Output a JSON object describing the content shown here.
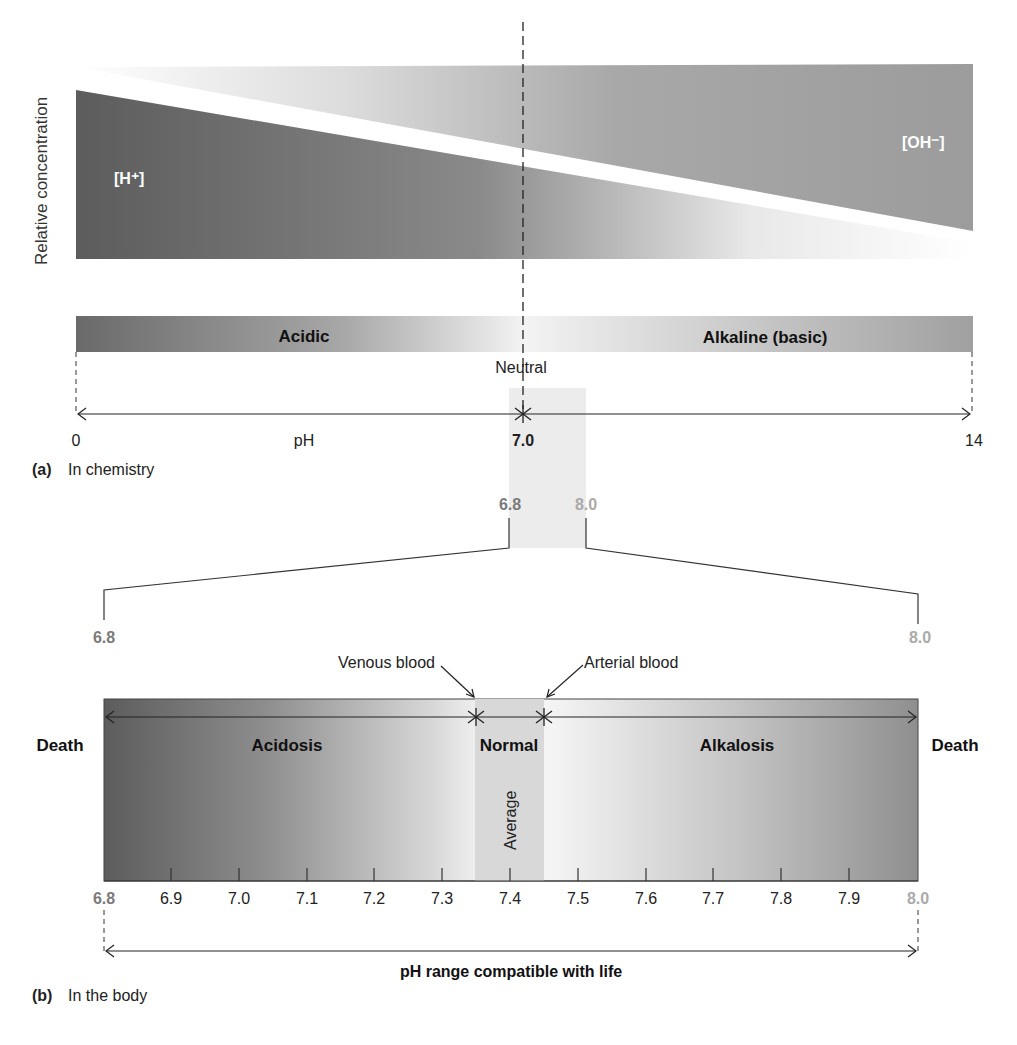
{
  "panel_a": {
    "y_axis_label": "Relative concentration",
    "h_label": "[H⁺]",
    "oh_label": "[OH⁻]",
    "bar_acidic": "Acidic",
    "bar_alkaline": "Alkaline (basic)",
    "neutral_label": "Neutral",
    "scale_min": "0",
    "scale_mid": "7.0",
    "scale_max": "14",
    "axis_name": "pH",
    "caption_letter": "(a)",
    "caption_text": "In chemistry",
    "zoom_low": "6.8",
    "zoom_high": "8.0"
  },
  "panel_b": {
    "range_low": "6.8",
    "range_high": "8.0",
    "venous_label": "Venous blood",
    "arterial_label": "Arterial blood",
    "death_left": "Death",
    "death_right": "Death",
    "acidosis": "Acidosis",
    "normal": "Normal",
    "alkalosis": "Alkalosis",
    "average": "Average",
    "ticks": [
      "6.8",
      "6.9",
      "7.0",
      "7.1",
      "7.2",
      "7.3",
      "7.4",
      "7.5",
      "7.6",
      "7.7",
      "7.8",
      "7.9",
      "8.0"
    ],
    "life_range_label": "pH range compatible with life",
    "caption_letter": "(b)",
    "caption_text": "In the body"
  },
  "colors": {
    "dark_gray": "#5a5a5a",
    "mid_gray": "#9a9a9a",
    "light_gray": "#e6e6e6",
    "highlight": "#a3a3a3"
  }
}
